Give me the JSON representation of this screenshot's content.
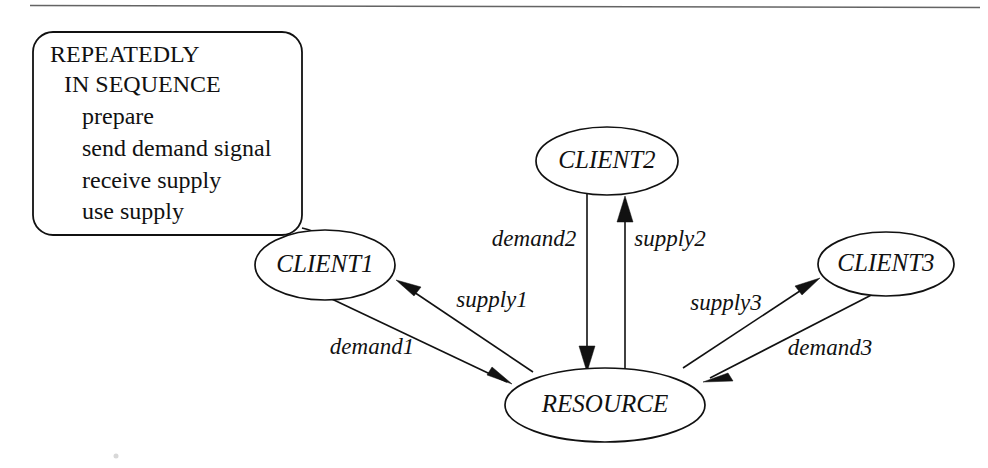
{
  "diagram": {
    "note": {
      "lines": [
        "REPEATEDLY",
        "IN SEQUENCE",
        "prepare",
        "send demand signal",
        "receive supply",
        "use supply"
      ]
    },
    "nodes": [
      {
        "id": "client1",
        "label": "CLIENT1"
      },
      {
        "id": "client2",
        "label": "CLIENT2"
      },
      {
        "id": "client3",
        "label": "CLIENT3"
      },
      {
        "id": "resource",
        "label": "RESOURCE"
      }
    ],
    "edges": [
      {
        "id": "demand1",
        "label": "demand1",
        "from": "CLIENT1",
        "to": "RESOURCE"
      },
      {
        "id": "supply1",
        "label": "supply1",
        "from": "RESOURCE",
        "to": "CLIENT1"
      },
      {
        "id": "demand2",
        "label": "demand2",
        "from": "CLIENT2",
        "to": "RESOURCE"
      },
      {
        "id": "supply2",
        "label": "supply2",
        "from": "RESOURCE",
        "to": "CLIENT2"
      },
      {
        "id": "demand3",
        "label": "demand3",
        "from": "CLIENT3",
        "to": "RESOURCE"
      },
      {
        "id": "supply3",
        "label": "supply3",
        "from": "RESOURCE",
        "to": "CLIENT3"
      }
    ],
    "colors": {
      "stroke": "#111111",
      "background": "#ffffff"
    }
  }
}
